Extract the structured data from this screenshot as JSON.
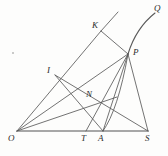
{
  "figure": {
    "kind": "geometry-diagram",
    "title": "",
    "background_color": "#fdfdfc",
    "stroke_color": "#5a5a5a",
    "baseline_color": "#8a8a8a",
    "label_color": "#2b2b2b"
  },
  "points": [
    {
      "id": "O",
      "label": "O",
      "x": 17,
      "y": 131,
      "label_x": 8,
      "label_y": 134
    },
    {
      "id": "T",
      "label": "T",
      "x": 86,
      "y": 131,
      "label_x": 81,
      "label_y": 134
    },
    {
      "id": "A",
      "label": "A",
      "x": 103,
      "y": 131,
      "label_x": 98,
      "label_y": 134
    },
    {
      "id": "S",
      "label": "S",
      "x": 148,
      "y": 131,
      "label_x": 146,
      "label_y": 134
    },
    {
      "id": "I",
      "label": "I",
      "x": 55,
      "y": 75,
      "label_x": 47,
      "label_y": 68
    },
    {
      "id": "N",
      "label": "N",
      "x": 93,
      "y": 101,
      "label_x": 87,
      "label_y": 92
    },
    {
      "id": "K",
      "label": "K",
      "x": 101,
      "y": 31,
      "label_x": 93,
      "label_y": 24
    },
    {
      "id": "P",
      "label": "P",
      "x": 128,
      "y": 54,
      "label_x": 133,
      "label_y": 50
    },
    {
      "id": "Q",
      "label": "Q",
      "x": 155,
      "y": 13,
      "label_x": 155,
      "label_y": 6
    }
  ],
  "segments": [
    {
      "name": "baseline-O-S",
      "from": "O",
      "to": "S",
      "weight": 1.5,
      "color": "#8a8a8a"
    },
    {
      "name": "ray-O-K",
      "from": "O",
      "to": "K",
      "weight": 0.9,
      "color": "#5a5a5a"
    },
    {
      "name": "ray-K-extend",
      "from": "K",
      "to": "Kx",
      "weight": 0.9,
      "color": "#5a5a5a"
    },
    {
      "name": "chord-K-P",
      "from": "K",
      "to": "P",
      "weight": 0.9,
      "color": "#5a5a5a"
    },
    {
      "name": "ray-O-P",
      "from": "O",
      "to": "P",
      "weight": 0.9,
      "color": "#5a5a5a"
    },
    {
      "name": "line-P-S",
      "from": "P",
      "to": "S",
      "weight": 0.9,
      "color": "#5a5a5a"
    },
    {
      "name": "line-P-A",
      "from": "P",
      "to": "A",
      "weight": 0.9,
      "color": "#5a5a5a"
    },
    {
      "name": "line-P-T",
      "from": "P",
      "to": "T",
      "weight": 0.9,
      "color": "#5a5a5a"
    },
    {
      "name": "line-I-S",
      "from": "I",
      "to": "S",
      "weight": 0.9,
      "color": "#5a5a5a"
    },
    {
      "name": "line-I-A",
      "from": "I",
      "to": "A",
      "weight": 0.9,
      "color": "#5a5a5a"
    },
    {
      "name": "line-O-N-seg",
      "from": "O",
      "to": "N",
      "weight": 0.9,
      "color": "#5a5a5a"
    }
  ],
  "arcs": [
    {
      "name": "arc-P-Q",
      "from": "P",
      "to": "Q",
      "bulge": 7,
      "color": "#5a5a5a"
    },
    {
      "name": "arc-A-P",
      "from": "A",
      "to": "P",
      "bulge": 10,
      "color": "#5a5a5a"
    }
  ],
  "marks": [
    {
      "name": "speck",
      "x": 12,
      "y": 52
    }
  ]
}
